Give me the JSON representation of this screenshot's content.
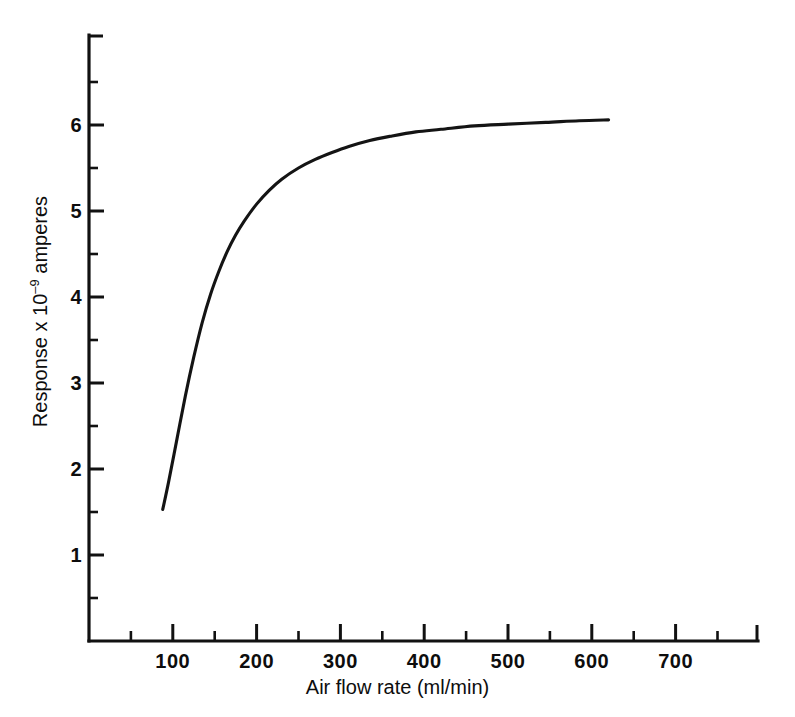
{
  "chart_data": {
    "type": "line",
    "title": "",
    "xlabel": "Air flow rate (ml/min)",
    "ylabel": "Response x 10^-9 amperes",
    "ylabel_parts": {
      "prefix": "Response  x 10",
      "exponent": "–9",
      "suffix": " amperes"
    },
    "xlim": [
      0,
      800
    ],
    "ylim": [
      0,
      7
    ],
    "xticks": [
      100,
      200,
      300,
      400,
      500,
      600,
      700
    ],
    "xtick_labels": [
      "100",
      "200",
      "300",
      "400",
      "500",
      "600",
      "700"
    ],
    "x_minor_ticks": [
      50,
      150,
      250,
      350,
      450,
      550,
      650,
      750
    ],
    "yticks": [
      1,
      2,
      3,
      4,
      5,
      6
    ],
    "ytick_labels": [
      "1",
      "2",
      "3",
      "4",
      "5",
      "6"
    ],
    "y_minor_ticks": [
      0.5,
      1.5,
      2.5,
      3.5,
      4.5,
      5.5,
      6.5
    ],
    "grid": false,
    "legend": false,
    "series": [
      {
        "name": "Response",
        "x": [
          88,
          95,
          105,
          115,
          125,
          135,
          145,
          155,
          165,
          175,
          185,
          200,
          215,
          230,
          250,
          270,
          290,
          310,
          335,
          360,
          390,
          420,
          460,
          500,
          545,
          585,
          620
        ],
        "y": [
          1.53,
          1.85,
          2.35,
          2.85,
          3.3,
          3.7,
          4.03,
          4.3,
          4.53,
          4.72,
          4.88,
          5.08,
          5.24,
          5.37,
          5.5,
          5.6,
          5.68,
          5.75,
          5.82,
          5.87,
          5.92,
          5.95,
          5.99,
          6.01,
          6.03,
          6.05,
          6.06
        ]
      }
    ],
    "curve_start": {
      "x": 88,
      "y": 1.53
    },
    "curve_end": {
      "x": 620,
      "y": 6.06
    },
    "plateau_value": 6.06
  },
  "axes_geometry": {
    "x_pixel_at_zero": 89,
    "x_pixels_per_100_units": 83.8,
    "y_pixel_at_zero": 641,
    "y_pixels_per_unit": 86.0,
    "axis_top_y": 35,
    "axis_right_x": 758
  }
}
